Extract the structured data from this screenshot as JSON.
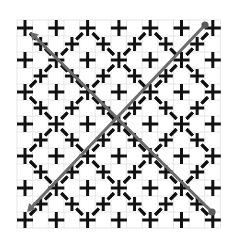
{
  "diagram": {
    "type": "lattice-pattern",
    "width": 233,
    "height": 247,
    "colors": {
      "background": "#ffffff",
      "grid": "#e6e6e6",
      "cross": "#111111",
      "dash": "#111111",
      "path_line": "#6b6b6b",
      "endpoint": "#5a5a5a"
    },
    "lattice": {
      "origin_x": 25,
      "origin_y": 28,
      "step_x": 31.3,
      "step_y": 32,
      "cols": 7,
      "rows": 7,
      "main_cross_half": 8,
      "offset_cross_half": 7,
      "stroke": 3,
      "star_rule": "main crosses where (col+row) is even carry diagonal dashes toward neighbouring offset crosses",
      "offset_crosses": "present at every half-step position (6x6)"
    },
    "background_grid": {
      "spacing_x": 15.65,
      "spacing_y": 16,
      "start_x": 17,
      "start_y": 20,
      "end_x": 221,
      "end_y": 228
    },
    "lines": [
      {
        "name": "diagonal-line-1",
        "from": [
          212,
          212
        ],
        "to": [
          30,
          32
        ],
        "start_marker": "dot",
        "end_marker": "arrow"
      },
      {
        "name": "diagonal-line-2",
        "from": [
          205,
          25
        ],
        "to": [
          27,
          212
        ],
        "start_marker": "dot",
        "end_marker": "arrow"
      }
    ]
  }
}
